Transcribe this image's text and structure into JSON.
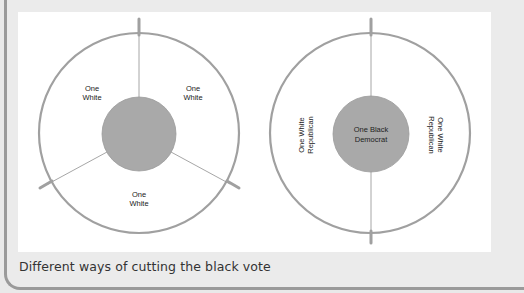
{
  "figure": {
    "left_diagram": {
      "inner_label": "",
      "segments": [
        {
          "line1": "One",
          "line2": "White"
        },
        {
          "line1": "One",
          "line2": "White"
        },
        {
          "line1": "One",
          "line2": "White"
        }
      ]
    },
    "right_diagram": {
      "inner_label_line1": "One Black",
      "inner_label_line2": "Democrat",
      "left_segment": {
        "line1": "One White",
        "line2": "Republican"
      },
      "right_segment": {
        "line1": "One White",
        "line2": "Republican"
      }
    },
    "colors": {
      "inner_fill": "#a9a9a9",
      "ring_stroke": "#9d9d9d",
      "divider": "#8f8f8f",
      "panel": "#ffffff",
      "background": "#ebebeb"
    }
  },
  "caption": "Different ways of cutting the black vote"
}
